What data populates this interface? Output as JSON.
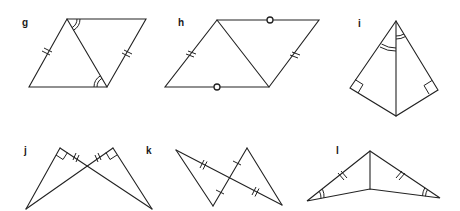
{
  "figures": [
    {
      "id": "g",
      "label": "g",
      "label_pos": [
        22,
        18
      ],
      "shape": "parallelogram with diagonal",
      "marks": [
        "double tick on left side",
        "double tick on right side",
        "double arc angle at top-left vertex",
        "double arc angle at bottom-right vertex"
      ]
    },
    {
      "id": "h",
      "label": "h",
      "label_pos": [
        178,
        18
      ],
      "shape": "parallelogram with diagonal",
      "marks": [
        "double tick on left side",
        "double tick on right side",
        "circle mark on top side",
        "circle mark on bottom side"
      ]
    },
    {
      "id": "i",
      "label": "i",
      "label_pos": [
        358,
        19
      ],
      "shape": "kite with vertical diagonal",
      "marks": [
        "double arc angle left of apex",
        "double arc angle right of apex",
        "right angle at left vertex",
        "right angle at right vertex"
      ]
    },
    {
      "id": "j",
      "label": "j",
      "label_pos": [
        24,
        146
      ],
      "shape": "two crossing right triangles",
      "marks": [
        "right angle at left top vertex",
        "right angle at right top vertex",
        "double tick on left top segment",
        "double tick on right top segment"
      ]
    },
    {
      "id": "k",
      "label": "k",
      "label_pos": [
        146,
        146
      ],
      "shape": "two triangles sharing crossing point (bow-tie)",
      "marks": [
        "double tick on long diagonal, upper part",
        "double tick on long diagonal, lower part",
        "single tick on short diagonal, upper part",
        "single tick on short diagonal, lower part"
      ]
    },
    {
      "id": "l",
      "label": "l",
      "label_pos": [
        336,
        146
      ],
      "shape": "two triangles sharing a vertical side",
      "marks": [
        "double tick on left slanted side",
        "double tick on right slanted side",
        "double arc angle at left vertex",
        "double arc angle at right vertex"
      ]
    }
  ],
  "colors": {
    "line": "#222222",
    "background": "#ffffff"
  }
}
